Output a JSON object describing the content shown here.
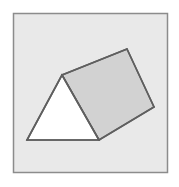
{
  "figure": {
    "kind": "geometry-figure",
    "canvas": {
      "width": 179,
      "height": 187,
      "background": "#ffffff"
    },
    "frame": {
      "name": "figure-border",
      "x": 13.5,
      "y": 13.5,
      "width": 154,
      "height": 159,
      "fill": "#e9e9e9",
      "stroke": "#8c8c8c",
      "stroke_width": 1.5
    },
    "shapes": [
      {
        "name": "prism-front-triangular-face",
        "type": "polygon",
        "points": "62,75 27,140 99,140",
        "fill": "#ffffff",
        "stroke": "#5f5f5f",
        "stroke_width": 1.6
      },
      {
        "name": "prism-top-rectangular-face",
        "type": "polygon",
        "points": "62,75 127,49 154,107 99,140",
        "fill": "#d2d2d2",
        "stroke": "#5f5f5f",
        "stroke_width": 1.6
      }
    ],
    "edges": [
      {
        "name": "edge-apex-to-left-base",
        "x1": 62,
        "y1": 75,
        "x2": 27,
        "y2": 140
      },
      {
        "name": "edge-base-bottom",
        "x1": 27,
        "y1": 140,
        "x2": 99,
        "y2": 140
      },
      {
        "name": "edge-apex-to-right-base",
        "x1": 62,
        "y1": 75,
        "x2": 99,
        "y2": 140
      },
      {
        "name": "edge-apex-to-far-apex",
        "x1": 62,
        "y1": 75,
        "x2": 127,
        "y2": 49
      },
      {
        "name": "edge-far-ridge",
        "x1": 127,
        "y1": 49,
        "x2": 154,
        "y2": 107
      },
      {
        "name": "edge-far-base",
        "x1": 154,
        "y1": 107,
        "x2": 99,
        "y2": 140
      }
    ],
    "colors": {
      "shaded_face": "#d2d2d2",
      "unshaded_face": "#ffffff",
      "outline": "#5f5f5f",
      "panel_background": "#e9e9e9",
      "panel_border": "#8c8c8c"
    }
  }
}
